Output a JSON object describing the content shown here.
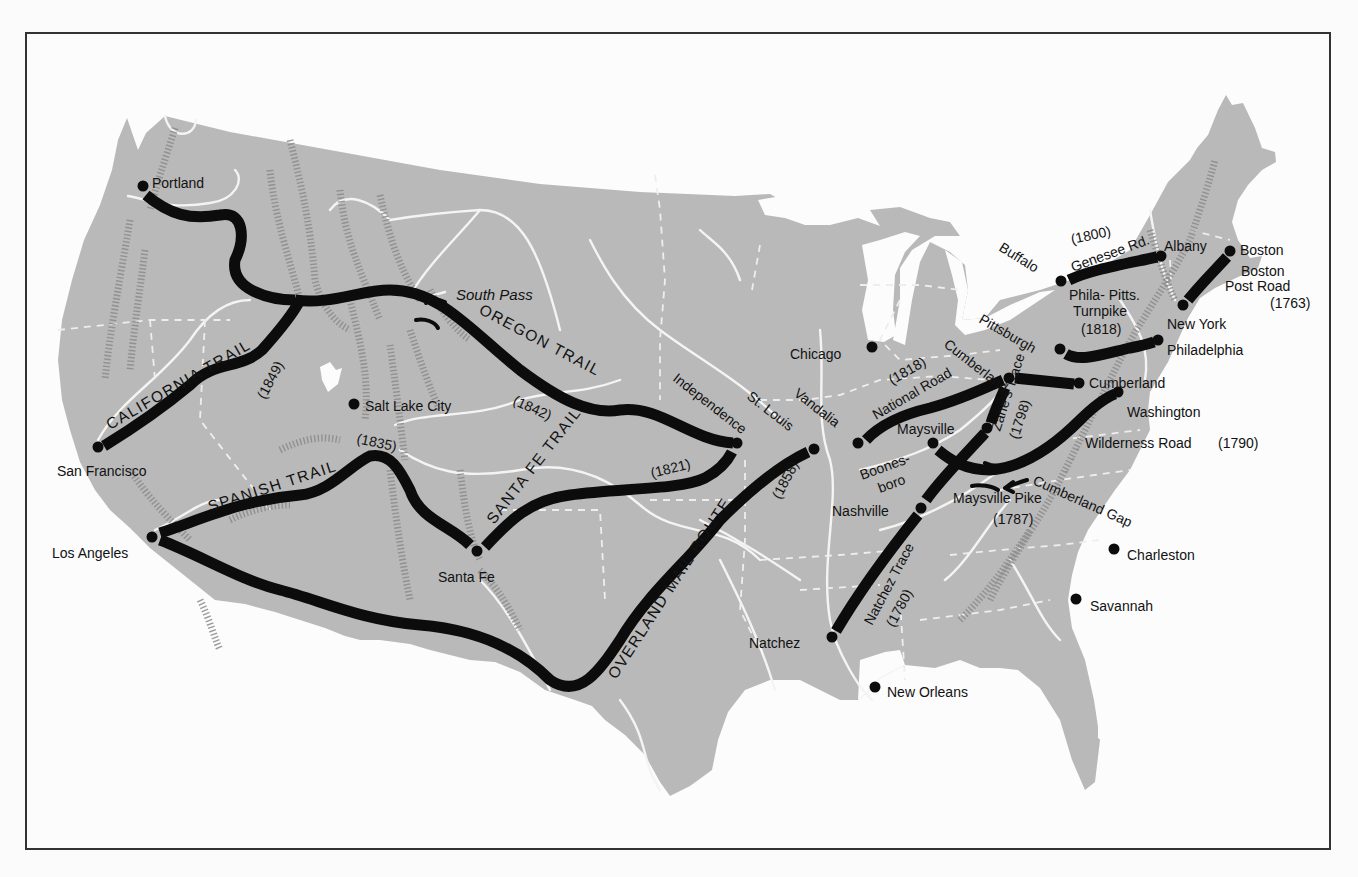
{
  "map": {
    "title": "Early Trails and Roads of the United States",
    "colors": {
      "land": "#b9b9b9",
      "trail": "#0c0c0c",
      "river": "#f4f4f4",
      "frame": "#333333"
    },
    "cities": [
      {
        "name": "Portland",
        "x": 143,
        "y": 186,
        "lx": 152,
        "ly": 183
      },
      {
        "name": "San Francisco",
        "x": 98,
        "y": 447,
        "lx": 57,
        "ly": 471
      },
      {
        "name": "Los Angeles",
        "x": 152,
        "y": 537,
        "lx": 52,
        "ly": 553
      },
      {
        "name": "Salt Lake City",
        "x": 354,
        "y": 404,
        "lx": 365,
        "ly": 406
      },
      {
        "name": "Santa Fe",
        "x": 477,
        "y": 551,
        "lx": 438,
        "ly": 577
      },
      {
        "name": "Independence",
        "x": 737,
        "y": 443
      },
      {
        "name": "St. Louis",
        "x": 814,
        "y": 449
      },
      {
        "name": "Chicago",
        "x": 872,
        "y": 347,
        "lx": 790,
        "ly": 354
      },
      {
        "name": "Vandalia",
        "x": 858,
        "y": 443
      },
      {
        "name": "Nashville",
        "x": 921,
        "y": 508,
        "lx": 832,
        "ly": 511
      },
      {
        "name": "Natchez",
        "x": 832,
        "y": 637,
        "lx": 749,
        "ly": 643
      },
      {
        "name": "New Orleans",
        "x": 875,
        "y": 687,
        "lx": 887,
        "ly": 692
      },
      {
        "name": "Maysville",
        "x": 987,
        "y": 428,
        "lx": 897,
        "ly": 429
      },
      {
        "name": "Boonesboro",
        "x": 933,
        "y": 443
      },
      {
        "name": "Zanesville",
        "x": 1009,
        "y": 378
      },
      {
        "name": "Pittsburgh",
        "x": 1060,
        "y": 349
      },
      {
        "name": "Cumberland",
        "x": 1079,
        "y": 383,
        "lx": 1089,
        "ly": 383
      },
      {
        "name": "Washington",
        "x": 1118,
        "y": 392,
        "lx": 1127,
        "ly": 412
      },
      {
        "name": "Philadelphia",
        "x": 1158,
        "y": 340,
        "lx": 1167,
        "ly": 350
      },
      {
        "name": "New York",
        "x": 1183,
        "y": 305,
        "lx": 1167,
        "ly": 324
      },
      {
        "name": "Buffalo",
        "x": 1061,
        "y": 281
      },
      {
        "name": "Albany",
        "x": 1161,
        "y": 256,
        "lx": 1164,
        "ly": 246
      },
      {
        "name": "Boston",
        "x": 1230,
        "y": 251,
        "lx": 1240,
        "ly": 250
      },
      {
        "name": "Charleston",
        "x": 1114,
        "y": 549,
        "lx": 1127,
        "ly": 555
      },
      {
        "name": "Savannah",
        "x": 1076,
        "y": 599,
        "lx": 1090,
        "ly": 606
      }
    ],
    "trails": [
      {
        "id": "oregon",
        "name": "OREGON TRAIL",
        "year": "(1842)"
      },
      {
        "id": "california",
        "name": "CALIFORNIA TRAIL",
        "year": "(1849)"
      },
      {
        "id": "spanish",
        "name": "SPANISH TRAIL",
        "year": "(1835)"
      },
      {
        "id": "santafe",
        "name": "SANTA FE TRAIL",
        "year": "(1821)"
      },
      {
        "id": "overland",
        "name": "OVERLAND MAIL ROUTE",
        "year": "(1858)"
      },
      {
        "id": "national",
        "name": "National Road",
        "year": "(1818)"
      },
      {
        "id": "zanes",
        "name": "Zane's Trace",
        "year": "(1798)"
      },
      {
        "id": "natchez",
        "name": "Natchez Trace",
        "year": "(1780)"
      },
      {
        "id": "wilderness",
        "name": "Wilderness Road",
        "year": "(1790)"
      },
      {
        "id": "maysvillepike",
        "name": "Maysville Pike",
        "year": "(1787)"
      },
      {
        "id": "genesee",
        "name": "Genesee Rd.",
        "year": "(1800)"
      },
      {
        "id": "philapitts",
        "name": "Phila- Pitts. Turnpike",
        "line1": "Phila- Pitts.",
        "line2": "Turnpike",
        "year": "(1818)"
      },
      {
        "id": "bostonpost",
        "name": "Boston Post Road",
        "line1": "Boston",
        "line2": "Post Road",
        "year": "(1763)"
      }
    ],
    "landmarks": [
      {
        "name": "South Pass"
      },
      {
        "name": "Cumberland Gap"
      }
    ],
    "labels": {
      "boonesboro_1": "Boones-",
      "boonesboro_2": "boro"
    }
  }
}
